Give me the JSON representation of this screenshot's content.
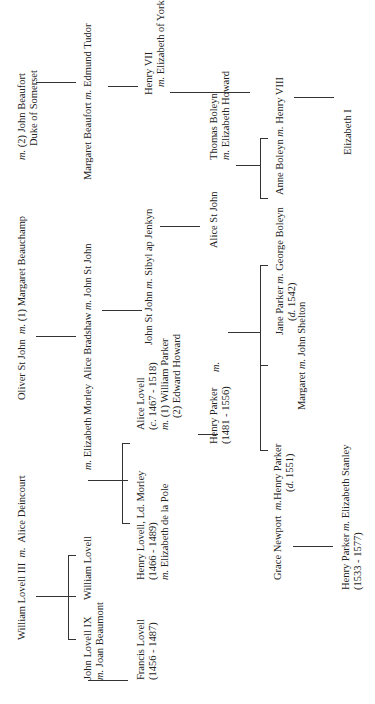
{
  "marriage_marker": "m.",
  "people": {
    "william_lovell_iii": "William Lovell III",
    "alice_deincourt": "Alice Deincourt",
    "john_lovell_ix": "John Lovell IX",
    "john_lovell_ix_spouse": "Joan Beaumont",
    "william_lovell": "William Lovell",
    "elizabeth_morley": "Elizabeth Morley",
    "francis_lovell": "Francis Lovell",
    "francis_lovell_dates": "(1456 - 1487)",
    "henry_lovell": "Henry Lovell, Ld. Morley",
    "henry_lovell_dates": "(1466 - 1489)",
    "henry_lovell_spouse": "Elizabeth de la Pole",
    "alice_lovell": "Alice Lovell",
    "alice_lovell_dates_prefix": "c.",
    "alice_lovell_dates": " 1467 - 1518)",
    "alice_lovell_spouse1": "(1) William Parker",
    "alice_lovell_spouse2": "(2) Edward Howard",
    "henry_parker_1481": "Henry Parker",
    "henry_parker_1481_dates": "(1481 - 1556)",
    "oliver_st_john": "Oliver St John",
    "margaret_beauchamp": "(1) Margaret Beauchamp",
    "john_beaufort": "(2) John Beaufort",
    "john_beaufort_title": "Duke of Somerset",
    "alice_bradshaw": "Alice Bradshaw",
    "john_st_john": "John St John",
    "john_st_john_jr": "John St John",
    "sibyl_ap_jenkyn": "Sibyl ap Jenkyn",
    "alice_st_john": "Alice St John",
    "margaret_beaufort": "Margaret Beaufort",
    "edmund_tudor": "Edmund Tudor",
    "henry_vii": "Henry VII",
    "elizabeth_of_york": "Elizabeth of York",
    "thomas_boleyn": "Thomas Boleyn",
    "elizabeth_howard": "Elizabeth Howard",
    "anne_boleyn": "Anne Boleyn",
    "henry_viii": "Henry VIII",
    "elizabeth_i": "Elizabeth I",
    "grace_newport": "Grace Newport",
    "henry_parker_1551": "Henry Parker",
    "henry_parker_1551_dates_prefix": "d.",
    "henry_parker_1551_dates": " 1551)",
    "margaret_parker": "Margaret",
    "john_shelton": "John Shelton",
    "jane_parker": "Jane Parker",
    "jane_parker_dates_prefix": "d.",
    "jane_parker_dates": " 1542)",
    "george_boleyn": "George Boleyn",
    "henry_parker_1533": "Henry Parker",
    "henry_parker_1533_dates": "(1533 - 1577)",
    "elizabeth_stanley": "Elizabeth Stanley"
  }
}
